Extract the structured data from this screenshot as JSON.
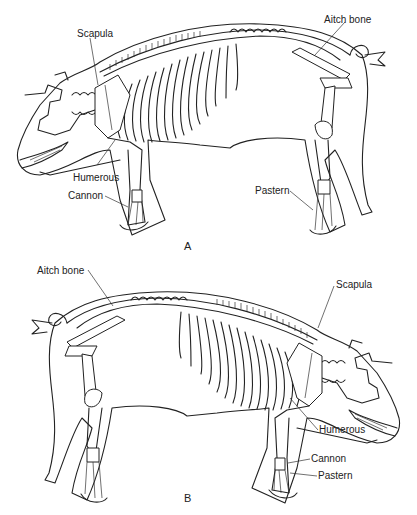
{
  "figure": {
    "panels": [
      {
        "id": "A",
        "caption": "A",
        "orientation": "facing-left",
        "labels": {
          "scapula": "Scapula",
          "aitch_bone": "Aitch bone",
          "humerous": "Humerous",
          "cannon": "Cannon",
          "pastern": "Pastern"
        }
      },
      {
        "id": "B",
        "caption": "B",
        "orientation": "facing-right",
        "labels": {
          "aitch_bone": "Aitch bone",
          "scapula": "Scapula",
          "humerous": "Humerous",
          "cannon": "Cannon",
          "pastern": "Pastern"
        }
      }
    ]
  }
}
